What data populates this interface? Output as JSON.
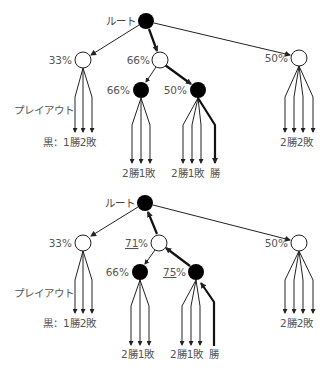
{
  "colors": {
    "line": "#222222",
    "text": "#555555",
    "node_black": "#000000",
    "node_white": "#ffffff"
  },
  "diagrams": [
    {
      "name": "selection-and-playout",
      "root_label": "ルート",
      "playout_label": "プレイアウト",
      "nodes": {
        "left": {
          "label": "33%",
          "fill": "white"
        },
        "middle": {
          "label": "66%",
          "fill": "white"
        },
        "right": {
          "label": "50%",
          "fill": "white"
        },
        "middle_left": {
          "label": "66%",
          "fill": "black"
        },
        "middle_right": {
          "label": "50%",
          "fill": "black"
        }
      },
      "leaf_labels": {
        "left": "黒：1勝2敗",
        "middle_left": "2勝1敗",
        "middle_right": "2勝1敗",
        "middle_right_new": "勝",
        "right": "2勝2敗"
      }
    },
    {
      "name": "backpropagation",
      "root_label": "ルート",
      "playout_label": "プレイアウト",
      "nodes": {
        "left": {
          "label": "33%",
          "fill": "white"
        },
        "middle": {
          "label_underlined": "71",
          "label_suffix": "%",
          "fill": "white"
        },
        "right": {
          "label": "50%",
          "fill": "white"
        },
        "middle_left": {
          "label": "66%",
          "fill": "black"
        },
        "middle_right": {
          "label_underlined": "75",
          "label_suffix": "%",
          "fill": "black"
        }
      },
      "leaf_labels": {
        "left": "黒：1勝2敗",
        "middle_left": "2勝1敗",
        "middle_right": "2勝1敗",
        "middle_right_new": "勝",
        "right": "2勝2敗"
      }
    }
  ]
}
